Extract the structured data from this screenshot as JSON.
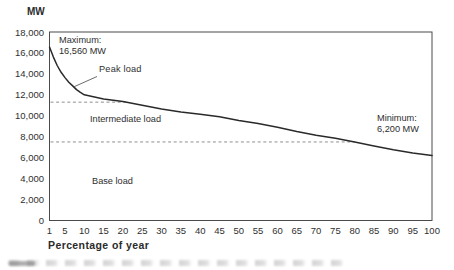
{
  "chart": {
    "y_axis_title": "MW",
    "x_axis_title": "Percentage of year",
    "y_ticks": [
      "18,000",
      "16,000",
      "14,000",
      "12,000",
      "10,000",
      "8,000",
      "6,000",
      "4,000",
      "2,000",
      "0"
    ],
    "x_ticks": [
      "1",
      "5",
      "10",
      "15",
      "20",
      "25",
      "30",
      "35",
      "40",
      "45",
      "50",
      "55",
      "60",
      "65",
      "70",
      "75",
      "80",
      "85",
      "90",
      "95",
      "100"
    ],
    "annotations": {
      "maximum_line1": "Maximum:",
      "maximum_line2": "16,560 MW",
      "peak": "Peak load",
      "intermediate": "Intermediate load",
      "base": "Base load",
      "minimum_line1": "Minimum:",
      "minimum_line2": "6,200 MW"
    }
  },
  "chart_data": {
    "type": "line",
    "title": "",
    "xlabel": "Percentage of year",
    "ylabel": "MW",
    "xlim": [
      1,
      100
    ],
    "ylim": [
      0,
      18000
    ],
    "grid": false,
    "legend": false,
    "x_tick_values": [
      1,
      5,
      10,
      15,
      20,
      25,
      30,
      35,
      40,
      45,
      50,
      55,
      60,
      65,
      70,
      75,
      80,
      85,
      90,
      95,
      100
    ],
    "y_tick_values": [
      18000,
      16000,
      14000,
      12000,
      10000,
      8000,
      6000,
      4000,
      2000,
      0
    ],
    "series": [
      {
        "name": "load-duration-curve",
        "x": [
          1,
          2,
          3,
          4,
          5,
          6,
          7,
          8,
          9,
          10,
          15,
          20,
          25,
          30,
          35,
          40,
          45,
          50,
          55,
          60,
          65,
          70,
          75,
          80,
          85,
          90,
          95,
          100
        ],
        "y": [
          16560,
          15600,
          14800,
          14150,
          13650,
          13200,
          12850,
          12500,
          12230,
          12000,
          11600,
          11350,
          11000,
          10650,
          10350,
          10150,
          9900,
          9550,
          9250,
          8900,
          8500,
          8150,
          7850,
          7500,
          7100,
          6750,
          6450,
          6200
        ]
      }
    ],
    "thresholds": [
      {
        "name": "peak-intermediate-boundary",
        "value": 11300,
        "ends_at_percent": 21,
        "style": "dashed"
      },
      {
        "name": "intermediate-base-boundary",
        "value": 7500,
        "ends_at_percent": 80,
        "style": "dashed"
      }
    ],
    "point_annotations": [
      {
        "text": "Maximum: 16,560 MW",
        "at_percent": 1,
        "value": 16560
      },
      {
        "text": "Peak load",
        "points_to_percent": 7
      },
      {
        "text": "Intermediate load",
        "region": "between thresholds"
      },
      {
        "text": "Base load",
        "region": "below lower threshold"
      },
      {
        "text": "Minimum: 6,200 MW",
        "at_percent": 100,
        "value": 6200
      }
    ]
  },
  "colors": {
    "curve": "#2a2a2a",
    "axis": "#4a4a4a",
    "dashed": "#8f8f8f",
    "pointer": "#5a5a5a",
    "text": "#2e2e2e",
    "background": "#ffffff"
  }
}
